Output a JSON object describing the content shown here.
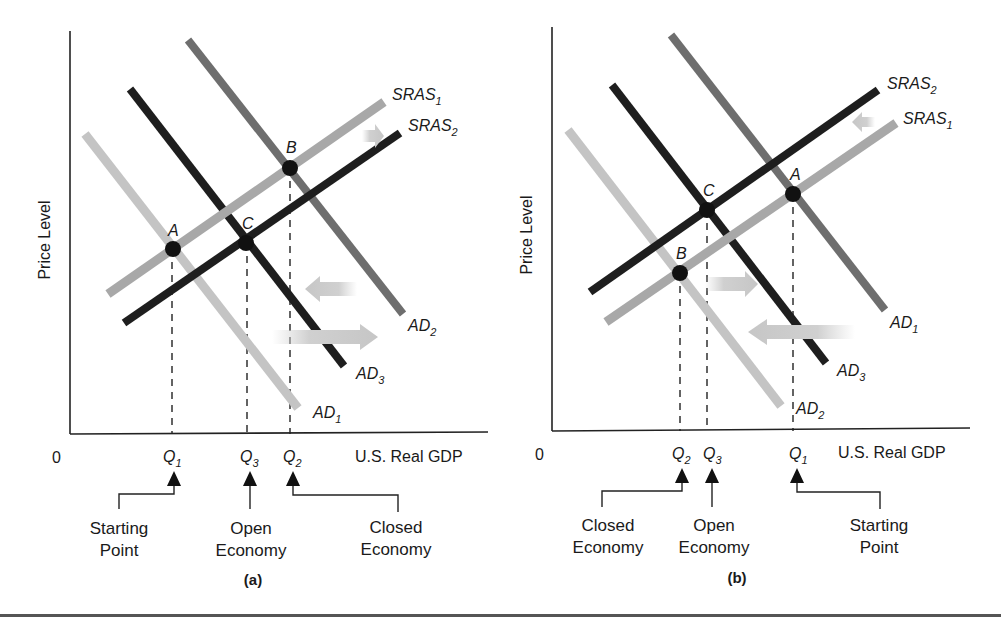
{
  "figure": {
    "bottom_rule": true
  },
  "panels": [
    {
      "id": "a",
      "caption": "(a)",
      "y_axis_label": "Price Level",
      "x_axis_label": "U.S. Real GDP",
      "origin_label": "0",
      "curves": [
        {
          "name": "SRAS",
          "sub": "1",
          "shade": "#a8a8a8"
        },
        {
          "name": "SRAS",
          "sub": "2",
          "shade": "#1e1e1e"
        },
        {
          "name": "AD",
          "sub": "1",
          "shade": "#c4c4c4"
        },
        {
          "name": "AD",
          "sub": "2",
          "shade": "#6e6e6e"
        },
        {
          "name": "AD",
          "sub": "3",
          "shade": "#1e1e1e"
        }
      ],
      "points": [
        {
          "label": "A"
        },
        {
          "label": "B"
        },
        {
          "label": "C"
        }
      ],
      "x_ticks": [
        {
          "name": "Q",
          "sub": "1"
        },
        {
          "name": "Q",
          "sub": "3"
        },
        {
          "name": "Q",
          "sub": "2"
        }
      ],
      "annotations": [
        {
          "line1": "Starting",
          "line2": "Point"
        },
        {
          "line1": "Open",
          "line2": "Economy"
        },
        {
          "line1": "Closed",
          "line2": "Economy"
        }
      ]
    },
    {
      "id": "b",
      "caption": "(b)",
      "y_axis_label": "Price Level",
      "x_axis_label": "U.S. Real GDP",
      "origin_label": "0",
      "curves": [
        {
          "name": "SRAS",
          "sub": "2",
          "shade": "#1e1e1e"
        },
        {
          "name": "SRAS",
          "sub": "1",
          "shade": "#a8a8a8"
        },
        {
          "name": "AD",
          "sub": "1",
          "shade": "#6e6e6e"
        },
        {
          "name": "AD",
          "sub": "2",
          "shade": "#c4c4c4"
        },
        {
          "name": "AD",
          "sub": "3",
          "shade": "#1e1e1e"
        }
      ],
      "points": [
        {
          "label": "A"
        },
        {
          "label": "B"
        },
        {
          "label": "C"
        }
      ],
      "x_ticks": [
        {
          "name": "Q",
          "sub": "2"
        },
        {
          "name": "Q",
          "sub": "3"
        },
        {
          "name": "Q",
          "sub": "1"
        }
      ],
      "annotations": [
        {
          "line1": "Closed",
          "line2": "Economy"
        },
        {
          "line1": "Open",
          "line2": "Economy"
        },
        {
          "line1": "Starting",
          "line2": "Point"
        }
      ]
    }
  ],
  "colors": {
    "dark": "#1e1e1e",
    "mid": "#6e6e6e",
    "light": "#a8a8a8",
    "lighter": "#c4c4c4",
    "arrow": "#d0d0d0"
  }
}
